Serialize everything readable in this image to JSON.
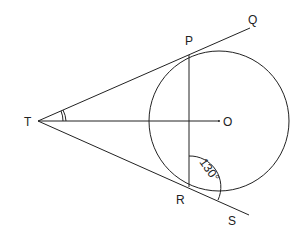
{
  "diagram": {
    "type": "geometry",
    "labels": {
      "T": "T",
      "P": "P",
      "Q": "Q",
      "O": "O",
      "R": "R",
      "S": "S",
      "angle": "130°"
    },
    "points": {
      "T": [
        38,
        121
      ],
      "P": [
        189,
        55
      ],
      "Q": [
        250,
        28
      ],
      "O": [
        219,
        121
      ],
      "R": [
        189,
        187
      ],
      "S": [
        249,
        215
      ]
    },
    "circle": {
      "cx": 219,
      "cy": 121,
      "r": 70
    },
    "color": "#222222"
  }
}
